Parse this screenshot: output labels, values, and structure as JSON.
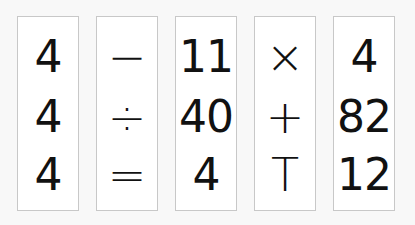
{
  "cards": [
    {
      "rows": [
        "4",
        "4",
        "4"
      ],
      "kind": "num"
    },
    {
      "rows": [
        "−",
        "÷",
        "="
      ],
      "kind": "op"
    },
    {
      "rows": [
        "11",
        "40",
        "4"
      ],
      "kind": "num"
    },
    {
      "rows": [
        "×",
        "+",
        "T"
      ],
      "kind": "op"
    },
    {
      "rows": [
        "4",
        "82",
        "12"
      ],
      "kind": "num"
    }
  ],
  "colors": {
    "background": "#f8f8f8",
    "card": "#ffffff",
    "card_border": "#c8c8c8",
    "text": "#111111"
  }
}
